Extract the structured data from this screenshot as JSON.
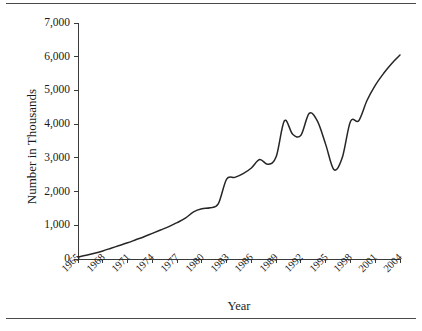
{
  "chart_data": {
    "type": "line",
    "title": "",
    "xlabel": "Year",
    "ylabel": "Number in Thousands",
    "xlim": [
      1965,
      2004
    ],
    "ylim": [
      0,
      7000
    ],
    "grid": false,
    "legend": null,
    "ytick_labels": [
      "7,000",
      "6,000",
      "5,000",
      "4,000",
      "3,000",
      "2,000",
      "1,000",
      "0"
    ],
    "ytick_values": [
      7000,
      6000,
      5000,
      4000,
      3000,
      2000,
      1000,
      0
    ],
    "xtick_labels": [
      "1965",
      "1968",
      "1971",
      "1974",
      "1977",
      "1980",
      "1983",
      "1986",
      "1989",
      "1992",
      "1995",
      "1998",
      "2001",
      "2004"
    ],
    "xtick_values": [
      1965,
      1968,
      1971,
      1974,
      1977,
      1980,
      1983,
      1986,
      1989,
      1992,
      1995,
      1998,
      2001,
      2004
    ],
    "series": [
      {
        "name": "Number in Thousands",
        "color": "#262626",
        "x": [
          1965,
          1966,
          1967,
          1968,
          1969,
          1970,
          1971,
          1972,
          1973,
          1974,
          1975,
          1976,
          1977,
          1978,
          1979,
          1980,
          1981,
          1982,
          1983,
          1984,
          1985,
          1986,
          1987,
          1988,
          1989,
          1990,
          1991,
          1992,
          1993,
          1994,
          1995,
          1996,
          1997,
          1998,
          1999,
          2000,
          2001,
          2002,
          2003,
          2004
        ],
        "values": [
          60,
          110,
          170,
          240,
          320,
          400,
          480,
          570,
          660,
          760,
          860,
          960,
          1080,
          1210,
          1400,
          1490,
          1520,
          1640,
          2370,
          2420,
          2530,
          2700,
          2950,
          2810,
          3030,
          4100,
          3700,
          3670,
          4320,
          4090,
          3400,
          2650,
          3000,
          4080,
          4100,
          4700,
          5150,
          5500,
          5800,
          6050
        ]
      }
    ]
  }
}
